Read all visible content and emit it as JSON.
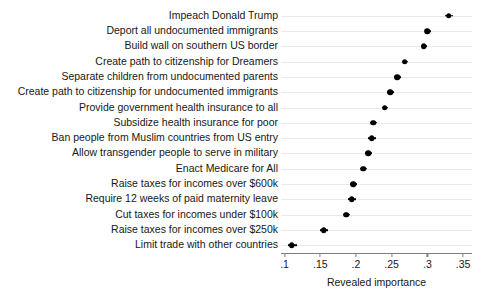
{
  "chart_data": {
    "type": "scatter",
    "title": "",
    "xlabel": "Revealed importance",
    "ylabel": "",
    "xlim": [
      0.095,
      0.3625
    ],
    "xticks": [
      0.1,
      0.15,
      0.2,
      0.25,
      0.3,
      0.35
    ],
    "xticklabels": [
      ".1",
      ".15",
      ".2",
      ".25",
      ".3",
      ".35"
    ],
    "grid": "horizontal",
    "legend": "none",
    "orientation": "horizontal",
    "error_bars": "horizontal confidence intervals",
    "categories": [
      "Impeach Donald Trump",
      "Deport all undocumented immigrants",
      "Build wall on southern US border",
      "Create path to citizenship for Dreamers",
      "Separate children from undocumented parents",
      "Create path to citizenship for undocumented immigrants",
      "Provide government health insurance to all",
      "Subsidize health insurance for poor",
      "Ban people from Muslim countries from US entry",
      "Allow transgender people to serve in military",
      "Enact Medicare for All",
      "Raise taxes for incomes over $600k",
      "Require 12 weeks of paid maternity leave",
      "Cut taxes for incomes under $100k",
      "Raise taxes for incomes over $250k",
      "Limit trade with other countries"
    ],
    "values": [
      0.33,
      0.3,
      0.295,
      0.268,
      0.258,
      0.248,
      0.24,
      0.224,
      0.222,
      0.217,
      0.21,
      0.196,
      0.194,
      0.186,
      0.155,
      0.11
    ],
    "ci_low": [
      0.325,
      0.296,
      0.291,
      0.264,
      0.253,
      0.244,
      0.236,
      0.22,
      0.217,
      0.212,
      0.205,
      0.192,
      0.189,
      0.182,
      0.15,
      0.105
    ],
    "ci_high": [
      0.336,
      0.305,
      0.3,
      0.273,
      0.263,
      0.253,
      0.245,
      0.229,
      0.228,
      0.223,
      0.216,
      0.201,
      0.2,
      0.191,
      0.161,
      0.117
    ]
  }
}
